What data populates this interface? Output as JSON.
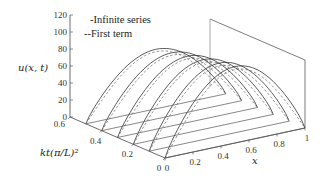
{
  "chart_data": {
    "type": "line",
    "subtype": "3d-line",
    "title": "",
    "xlabel": "x",
    "ylabel": "kt(π/L)^2",
    "zlabel": "u(x,t)",
    "x_ticks": [
      "0",
      "0.2",
      "0.4",
      "0.6",
      "0.8",
      "1"
    ],
    "t_ticks": [
      "0",
      "0.2",
      "0.4",
      "0.6"
    ],
    "u_ticks": [
      "0",
      "20",
      "40",
      "60",
      "80",
      "100",
      "120"
    ],
    "xlim": [
      0,
      1
    ],
    "tlim": [
      0,
      0.6
    ],
    "ulim": [
      0,
      120
    ],
    "legend": [
      {
        "label": "-Infinite series",
        "style": "solid"
      },
      {
        "label": "--First term",
        "style": "dashed"
      }
    ],
    "t_slices": [
      0.0,
      0.1,
      0.2,
      0.3,
      0.4,
      0.5
    ],
    "series": [
      {
        "name": "Infinite series",
        "style": "solid",
        "description": "u(x,t) profiles at each t slice; near-sine hump along x, peak ~85-90 decaying with t"
      },
      {
        "name": "First term",
        "style": "dashed",
        "description": "first Fourier term approximation, sine profile"
      }
    ],
    "peak_values": [
      90,
      86,
      82,
      78,
      74,
      70
    ],
    "grid": false,
    "legend_position": "upper-left"
  },
  "labels": {
    "u_axis": "u(x, t)",
    "t_axis": "kt(π/L)²",
    "x_axis": "x",
    "legend_solid": "-Infinite series",
    "legend_dashed": "--First term"
  }
}
